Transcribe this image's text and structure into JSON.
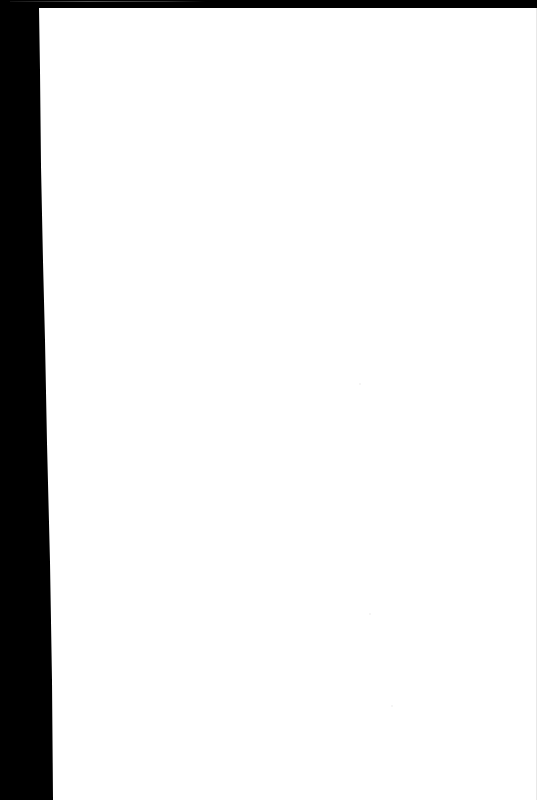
{
  "document": {
    "type": "scanned-page",
    "content_text": "",
    "colors": {
      "page": "#ffffff",
      "border": "#000000"
    }
  }
}
